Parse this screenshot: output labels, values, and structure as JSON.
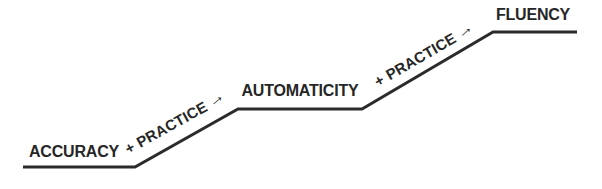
{
  "diagram": {
    "stages": [
      {
        "label": "ACCURACY"
      },
      {
        "label": "AUTOMATICITY"
      },
      {
        "label": "FLUENCY"
      }
    ],
    "transitions": [
      {
        "label": "+ PRACTICE",
        "arrow": "→"
      },
      {
        "label": "+ PRACTICE",
        "arrow": "→"
      }
    ],
    "colors": {
      "line": "#2b2b2b",
      "text": "#262626",
      "background": "#ffffff"
    }
  }
}
